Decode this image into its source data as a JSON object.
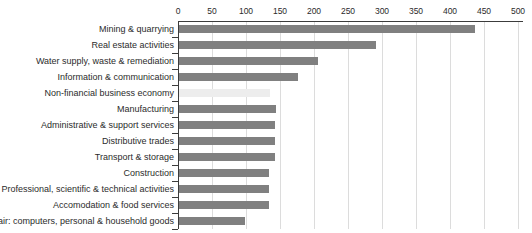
{
  "chart_data": {
    "type": "bar",
    "orientation": "horizontal",
    "title": "",
    "subtitle": "",
    "xlabel": "",
    "ylabel": "",
    "xlim": [
      0,
      500
    ],
    "ylim": null,
    "grid": true,
    "legend": null,
    "axis_position": "top",
    "xticks": [
      0,
      50,
      100,
      150,
      200,
      250,
      300,
      350,
      400,
      450,
      500
    ],
    "xticklabels": [
      "0",
      "50",
      "100",
      "150",
      "200",
      "250",
      "300",
      "350",
      "400",
      "450",
      "500"
    ],
    "categories": [
      "Mining & quarrying",
      "Real estate activities",
      "Water supply, waste & remediation",
      "Information & communication",
      "Non-financial business economy",
      "Manufacturing",
      "Administrative & support services",
      "Distributive trades",
      "Transport & storage",
      "Construction",
      "Professional, scientific & technical activities",
      "Accomodation & food services",
      "Repair: computers, personal & household goods"
    ],
    "values": [
      435,
      290,
      204,
      175,
      134,
      143,
      141,
      141,
      141,
      133,
      133,
      133,
      97
    ],
    "bar_styles": [
      "normal",
      "normal",
      "normal",
      "normal",
      "highlight",
      "normal",
      "normal",
      "normal",
      "normal",
      "normal",
      "normal",
      "normal",
      "normal"
    ],
    "colors": {
      "bar": "#808080",
      "bar_highlight": "#ededed",
      "axis": "#3c3c3c",
      "grid": "#dcdcdc",
      "text": "#2b2b2b",
      "background": "#ffffff"
    }
  }
}
